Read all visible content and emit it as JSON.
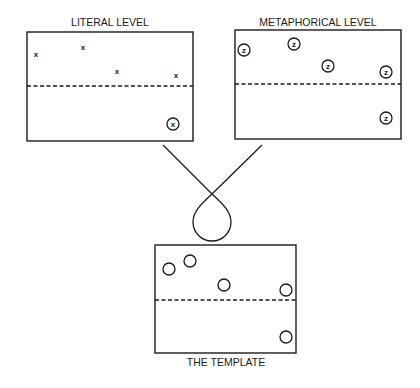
{
  "panels": [
    {
      "id": "literal",
      "title": "LITERAL LEVEL",
      "marker": "x",
      "items": [
        {
          "symbol": "x",
          "circled": false,
          "region": "upper"
        },
        {
          "symbol": "x",
          "circled": false,
          "region": "upper"
        },
        {
          "symbol": "x",
          "circled": false,
          "region": "upper"
        },
        {
          "symbol": "x",
          "circled": false,
          "region": "upper"
        },
        {
          "symbol": "x",
          "circled": true,
          "region": "lower"
        }
      ]
    },
    {
      "id": "metaphorical",
      "title": "METAPHORICAL LEVEL",
      "marker": "z",
      "items": [
        {
          "symbol": "z",
          "circled": true,
          "region": "upper"
        },
        {
          "symbol": "z",
          "circled": true,
          "region": "upper"
        },
        {
          "symbol": "z",
          "circled": true,
          "region": "upper"
        },
        {
          "symbol": "z",
          "circled": true,
          "region": "upper"
        },
        {
          "symbol": "z",
          "circled": true,
          "region": "lower"
        }
      ]
    },
    {
      "id": "template",
      "title": "THE TEMPLATE",
      "marker": "",
      "items": [
        {
          "symbol": "",
          "circled": true,
          "region": "upper"
        },
        {
          "symbol": "",
          "circled": true,
          "region": "upper"
        },
        {
          "symbol": "",
          "circled": true,
          "region": "upper"
        },
        {
          "symbol": "",
          "circled": true,
          "region": "upper"
        },
        {
          "symbol": "",
          "circled": true,
          "region": "lower"
        }
      ]
    }
  ],
  "connector": {
    "description": "two lines crossing and forming a loop that merges into the template"
  }
}
